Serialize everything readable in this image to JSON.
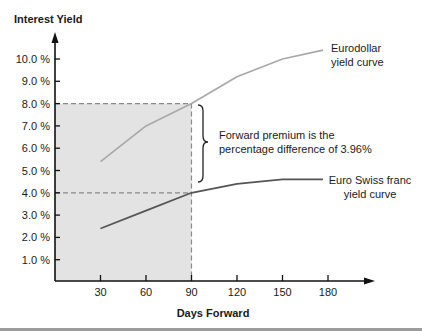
{
  "chart_data": {
    "type": "line",
    "title": "Interest Yield",
    "xlabel": "Days Forward",
    "ylabel": "Interest Yield",
    "x": [
      30,
      60,
      90,
      120,
      150,
      180
    ],
    "x_tick_labels": [
      "30",
      "60",
      "90",
      "120",
      "150",
      "180"
    ],
    "y_ticks": [
      1,
      2,
      3,
      4,
      5,
      6,
      7,
      8,
      9,
      10
    ],
    "y_tick_labels": [
      "1.0 %",
      "2.0 %",
      "3.0 %",
      "4.0 %",
      "5.0 %",
      "6.0 %",
      "7.0 %",
      "8.0 %",
      "9.0 %",
      "10.0 %"
    ],
    "xlim": [
      0,
      210
    ],
    "ylim": [
      0,
      10.8
    ],
    "grid": false,
    "legend": "inline labels at right end of each curve",
    "series": [
      {
        "id": "eurodollar",
        "name": "Eurodollar yield curve",
        "label_lines": [
          "Eurodollar",
          "yield curve"
        ],
        "values": [
          5.4,
          7.0,
          8.0,
          9.2,
          10.0,
          10.4
        ],
        "color": "#a9a9a9"
      },
      {
        "id": "euro-swiss-franc",
        "name": "Euro Swiss franc yield curve",
        "label_lines": [
          "Euro Swiss franc",
          "yield curve"
        ],
        "values": [
          2.4,
          3.2,
          4.0,
          4.4,
          4.6,
          4.6
        ],
        "color": "#555555"
      }
    ],
    "annotations": [
      {
        "type": "shaded_region",
        "x_range": [
          0,
          90
        ],
        "y_range": [
          0,
          8.0
        ]
      },
      {
        "type": "dashed_guide",
        "y": 8.0,
        "x_range": [
          0,
          90
        ]
      },
      {
        "type": "dashed_guide",
        "y": 4.0,
        "x_range": [
          0,
          90
        ]
      },
      {
        "type": "dashed_guide",
        "x": 90,
        "y_range": [
          0,
          8.0
        ]
      },
      {
        "type": "bracket",
        "text_lines": [
          "Forward premium is the",
          "percentage difference of 3.96%"
        ]
      }
    ]
  },
  "colors": {
    "axis": "#111111",
    "shade": "#e3e3e3",
    "guide": "#8a8a8a",
    "bracket": "#222222",
    "bottom_rule": "#9c9c9c"
  }
}
